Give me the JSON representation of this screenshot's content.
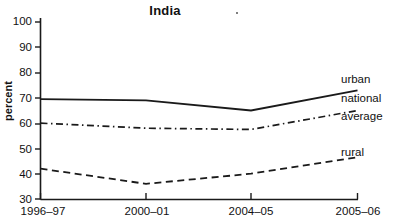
{
  "chart_data": {
    "type": "line",
    "title": "India",
    "xlabel": "",
    "ylabel": "percent",
    "categories": [
      "1996–97",
      "2000–01",
      "2004–05",
      "2005–06"
    ],
    "ylim": [
      30,
      100
    ],
    "yticks": [
      30,
      40,
      50,
      60,
      70,
      80,
      90,
      100
    ],
    "ytick_labels": [
      "30",
      "40",
      "50",
      "60",
      "70",
      "80",
      "90",
      "100"
    ],
    "grid": false,
    "legend_position": "right-inline-at-line-ends",
    "series": [
      {
        "name": "urban",
        "style": "solid",
        "color": "#1a1a1a",
        "values": [
          69.5,
          69,
          65,
          73
        ]
      },
      {
        "name": "national average",
        "style": "dash-dot",
        "color": "#1a1a1a",
        "values": [
          60,
          58,
          57.5,
          65
        ]
      },
      {
        "name": "rural",
        "style": "dashed",
        "color": "#1a1a1a",
        "values": [
          42,
          36,
          40,
          46.5
        ]
      }
    ],
    "series_labels": [
      {
        "text": "urban"
      },
      {
        "text": "national"
      },
      {
        "text": "average"
      },
      {
        "text": "rural"
      }
    ]
  }
}
